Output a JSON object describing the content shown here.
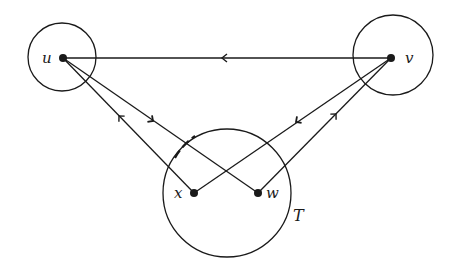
{
  "diagram": {
    "type": "graph",
    "stroke_color": "#1a1a1a",
    "background": "#ffffff",
    "vertices": [
      {
        "id": "u",
        "label": "u",
        "x": 63,
        "y": 58
      },
      {
        "id": "v",
        "label": "v",
        "x": 391,
        "y": 58
      },
      {
        "id": "x",
        "label": "x",
        "x": 194,
        "y": 193
      },
      {
        "id": "w",
        "label": "w",
        "x": 258,
        "y": 193
      }
    ],
    "circles": [
      {
        "id": "circle-u",
        "cx": 62,
        "cy": 57,
        "r": 34,
        "label": ""
      },
      {
        "id": "circle-v",
        "cx": 393,
        "cy": 55,
        "r": 40,
        "label": ""
      },
      {
        "id": "circle-T",
        "cx": 227,
        "cy": 193,
        "r": 64,
        "label": "T"
      }
    ],
    "edges": [
      {
        "from": "v",
        "to": "u",
        "arrow_direction": "toward u"
      },
      {
        "from": "x",
        "to": "u",
        "arrow_direction": "toward u"
      },
      {
        "from": "u",
        "to": "w",
        "arrow_direction": "toward w"
      },
      {
        "from": "v",
        "to": "x",
        "arrow_direction": "toward x"
      },
      {
        "from": "w",
        "to": "v",
        "arrow_direction": "toward v"
      }
    ],
    "region_label": "T"
  }
}
